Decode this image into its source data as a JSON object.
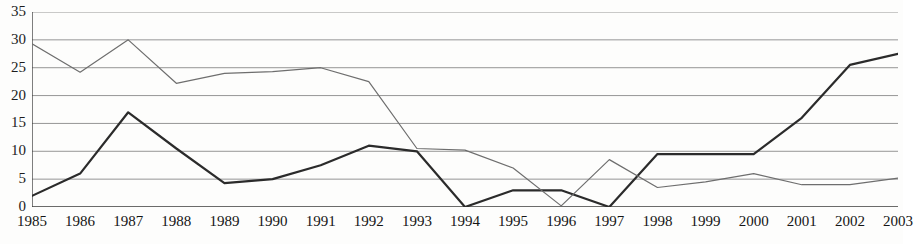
{
  "chart_data": {
    "type": "line",
    "title": "",
    "subtitle": "",
    "xlabel": "",
    "ylabel": "",
    "categories": [
      "1985",
      "1986",
      "1987",
      "1988",
      "1989",
      "1990",
      "1991",
      "1992",
      "1993",
      "1994",
      "1995",
      "1996",
      "1997",
      "1998",
      "1999",
      "2000",
      "2001",
      "2002",
      "2003"
    ],
    "ylim": [
      0,
      35
    ],
    "ytick_values": [
      0,
      5,
      10,
      15,
      20,
      25,
      30,
      35
    ],
    "ytick_labels": [
      "0",
      "5",
      "10",
      "15",
      "20",
      "25",
      "30",
      "35"
    ],
    "grid": "horizontal",
    "legend": "none",
    "series": [
      {
        "name": "series-1",
        "style": "solid-thick",
        "color": "#2b2b2b",
        "values": [
          2.0,
          6.0,
          17.0,
          10.5,
          4.3,
          5.0,
          7.5,
          11.0,
          10.0,
          0.0,
          3.0,
          3.0,
          0.0,
          9.5,
          9.5,
          9.5,
          16.0,
          25.5,
          27.5
        ]
      },
      {
        "name": "series-2",
        "style": "solid-thin",
        "color": "#6e6e6e",
        "values": [
          29.3,
          24.2,
          30.0,
          22.2,
          24.0,
          24.3,
          25.0,
          22.5,
          10.5,
          10.2,
          7.0,
          0.2,
          8.5,
          3.5,
          4.5,
          6.0,
          4.0,
          4.0,
          5.2
        ]
      }
    ]
  },
  "axis": {
    "y_axis_line_color": "#3a3a3a",
    "x_axis_line_color": "#3a3a3a",
    "grid_color": "#8a8a8a"
  }
}
